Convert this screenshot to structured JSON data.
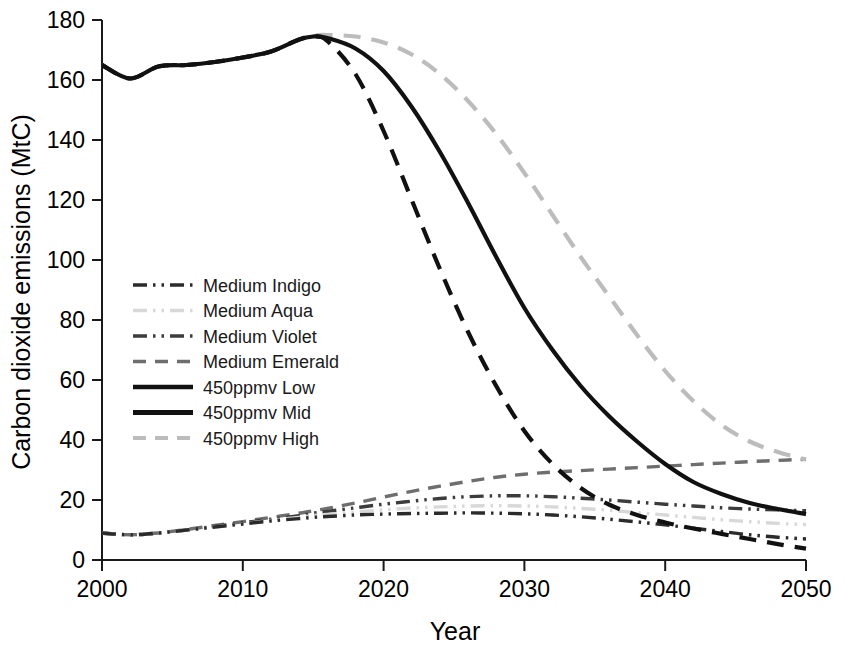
{
  "chart_data": {
    "type": "line",
    "title": "",
    "xlabel": "Year",
    "ylabel": "Carbon dioxide emissions (MtC)",
    "xlim": [
      2000,
      2050
    ],
    "ylim": [
      0,
      180
    ],
    "xticks": [
      "2000",
      "2010",
      "2020",
      "2030",
      "2040",
      "2050"
    ],
    "xtick_values": [
      2000,
      2010,
      2020,
      2030,
      2040,
      2050
    ],
    "yticks": [
      "0",
      "20",
      "40",
      "60",
      "80",
      "100",
      "120",
      "140",
      "160",
      "180"
    ],
    "ytick_values": [
      0,
      20,
      40,
      60,
      80,
      100,
      120,
      140,
      160,
      180
    ],
    "grid": false,
    "legend_position": "center-left",
    "x": [
      2000,
      2002,
      2004,
      2006,
      2008,
      2010,
      2012,
      2014,
      2015,
      2016,
      2018,
      2020,
      2022,
      2024,
      2026,
      2028,
      2030,
      2032,
      2034,
      2036,
      2038,
      2040,
      2042,
      2044,
      2046,
      2048,
      2050
    ],
    "series": [
      {
        "name": "Medium Indigo",
        "color": "#2b2b2b",
        "style": "dash-dot-dot",
        "width": 3.4,
        "values": [
          9.0,
          8.4,
          9.0,
          10.0,
          11.0,
          12.0,
          13.0,
          13.8,
          14.2,
          14.5,
          15.0,
          15.3,
          15.5,
          15.6,
          15.7,
          15.6,
          15.4,
          15.0,
          14.4,
          13.6,
          12.7,
          11.7,
          10.6,
          9.5,
          8.4,
          7.6,
          7.0
        ]
      },
      {
        "name": "Medium Aqua",
        "color": "#d8d8d8",
        "style": "dash-dot-dot",
        "width": 3.4,
        "values": [
          9.0,
          8.4,
          9.0,
          10.0,
          11.0,
          12.1,
          13.2,
          14.2,
          14.8,
          15.2,
          16.0,
          16.7,
          17.3,
          17.7,
          18.0,
          18.1,
          18.0,
          17.7,
          17.2,
          16.6,
          15.8,
          15.0,
          14.2,
          13.4,
          12.8,
          12.2,
          11.8
        ]
      },
      {
        "name": "Medium Violet",
        "color": "#3c3c3c",
        "style": "dash-dot-dot",
        "width": 3.4,
        "values": [
          9.0,
          8.4,
          9.0,
          10.0,
          11.2,
          12.4,
          13.6,
          14.8,
          15.6,
          16.2,
          17.4,
          18.6,
          19.6,
          20.5,
          21.1,
          21.4,
          21.4,
          21.1,
          20.6,
          20.0,
          19.3,
          18.6,
          18.0,
          17.4,
          17.0,
          16.7,
          16.4
        ]
      },
      {
        "name": "Medium Emerald",
        "color": "#6e6e6e",
        "style": "dash",
        "width": 3.4,
        "values": [
          9.0,
          8.4,
          9.0,
          10.2,
          11.5,
          12.8,
          14.2,
          15.6,
          16.4,
          17.2,
          19.0,
          21.0,
          22.9,
          24.6,
          26.2,
          27.6,
          28.6,
          29.3,
          29.8,
          30.3,
          30.8,
          31.3,
          31.8,
          32.3,
          32.8,
          33.2,
          33.6
        ]
      },
      {
        "name": "450ppmv Low",
        "color": "#111111",
        "style": "long-dash",
        "width": 4.2,
        "values": [
          165.0,
          160.5,
          164.5,
          165.0,
          166.0,
          167.5,
          169.5,
          173.5,
          174.5,
          173.0,
          162.0,
          143.0,
          120.0,
          97.0,
          76.0,
          58.0,
          43.0,
          32.0,
          24.0,
          18.5,
          15.0,
          12.5,
          10.5,
          8.7,
          7.0,
          5.3,
          3.8
        ]
      },
      {
        "name": "450ppmv Mid",
        "color": "#111111",
        "style": "solid",
        "width": 4.2,
        "values": [
          165.0,
          160.5,
          164.5,
          165.0,
          166.0,
          167.5,
          169.5,
          173.5,
          174.5,
          174.0,
          170.5,
          163.0,
          151.0,
          136.0,
          119.0,
          101.0,
          84.0,
          70.0,
          58.0,
          48.0,
          39.5,
          32.0,
          26.0,
          22.0,
          19.0,
          17.0,
          15.3
        ]
      },
      {
        "name": "450ppmv High",
        "color": "#bcbcbc",
        "style": "long-dash",
        "width": 4.2,
        "values": [
          165.0,
          160.5,
          164.5,
          165.0,
          166.0,
          167.5,
          169.5,
          173.5,
          174.8,
          175.0,
          174.5,
          172.5,
          168.5,
          162.0,
          153.0,
          142.0,
          129.0,
          115.0,
          101.0,
          88.0,
          75.0,
          63.0,
          53.0,
          45.0,
          39.5,
          36.0,
          33.5
        ]
      }
    ],
    "legend": [
      {
        "label": "Medium Indigo",
        "color": "#2b2b2b",
        "style": "dash-dot-dot",
        "width": 3.4
      },
      {
        "label": "Medium Aqua",
        "color": "#d8d8d8",
        "style": "dash-dot-dot",
        "width": 3.4
      },
      {
        "label": "Medium Violet",
        "color": "#3c3c3c",
        "style": "dash-dot-dot",
        "width": 3.4
      },
      {
        "label": "Medium Emerald",
        "color": "#6e6e6e",
        "style": "dash",
        "width": 3.4
      },
      {
        "label": "450ppmv Low",
        "color": "#111111",
        "style": "solid-thick",
        "width": 4.4
      },
      {
        "label": "450ppmv Mid",
        "color": "#111111",
        "style": "solid-thick",
        "width": 5.2
      },
      {
        "label": "450ppmv High",
        "color": "#bcbcbc",
        "style": "dash",
        "width": 4.0
      }
    ]
  }
}
